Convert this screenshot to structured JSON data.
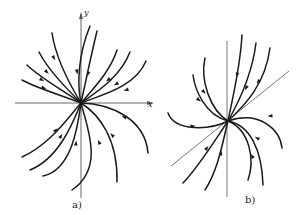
{
  "figure": {
    "stroke_color": "#1a1a1a",
    "axis_color": "#555555",
    "panel_a": {
      "label": "a)",
      "x_axis_label": "x",
      "y_axis_label": "y",
      "origin": [
        81,
        103
      ],
      "x_axis": [
        15,
        152
      ],
      "y_axis": [
        14,
        198
      ],
      "trajectories": [
        {
          "d": "M81,103 C70,85 56,60 52,33",
          "arrow": [
            54,
            58
          ],
          "dir": "in"
        },
        {
          "d": "M81,103 C68,90 48,70 39,52",
          "arrow": [
            47,
            72
          ],
          "dir": "in"
        },
        {
          "d": "M81,103 C66,92 40,78 27,65",
          "arrow": [
            42,
            80
          ],
          "dir": "in"
        },
        {
          "d": "M81,103 C64,96 36,88 22,80",
          "arrow": [
            44,
            88
          ],
          "dir": "in"
        },
        {
          "d": "M81,103 C77,85 78,55 90,26",
          "arrow": [
            77,
            72
          ],
          "dir": "in"
        },
        {
          "d": "M81,103 C85,85 90,60 97,31",
          "arrow": [
            88,
            74
          ],
          "dir": "in"
        },
        {
          "d": "M81,103 C92,90 110,72 117,50",
          "arrow": [
            108,
            80
          ],
          "dir": "in"
        },
        {
          "d": "M81,103 C95,93 120,78 130,52",
          "arrow": [
            116,
            84
          ],
          "dir": "in"
        },
        {
          "d": "M81,103 C98,96 135,88 146,61",
          "arrow": [
            126,
            90
          ],
          "dir": "in"
        },
        {
          "d": "M81,103 C70,115 50,145 22,157",
          "arrow": [
            56,
            130
          ],
          "dir": "in"
        },
        {
          "d": "M81,103 C74,120 60,158 30,170",
          "arrow": [
            61,
            136
          ],
          "dir": "in"
        },
        {
          "d": "M81,103 C78,125 72,170 43,176",
          "arrow": [
            76,
            143
          ],
          "dir": "in"
        },
        {
          "d": "M81,103 C88,130 104,168 72,190",
          "arrow": [
            99,
            142
          ],
          "dir": "in"
        },
        {
          "d": "M81,103 C100,115 118,140 117,182",
          "arrow": [
            112,
            135
          ],
          "dir": "in"
        },
        {
          "d": "M81,103 C110,104 145,118 148,153",
          "arrow": [
            124,
            117
          ],
          "dir": "in"
        }
      ]
    },
    "panel_b": {
      "label": "b)",
      "origin": [
        228,
        121
      ],
      "vertical_axis": [
        41,
        197
      ],
      "diagonal": [
        [
          171,
          166
        ],
        [
          289,
          71
        ]
      ],
      "trajectories": [
        {
          "d": "M228,121 C205,115 195,90 193,75",
          "arrow": [
            199,
            100
          ],
          "dir": "in"
        },
        {
          "d": "M228,121 C210,110 200,80 205,58",
          "arrow": [
            204,
            92
          ],
          "dir": "in"
        },
        {
          "d": "M228,121 C232,100 240,70 242,35",
          "arrow": [
            237,
            75
          ],
          "dir": "in"
        },
        {
          "d": "M228,121 C240,100 252,75 256,43",
          "arrow": [
            246,
            88
          ],
          "dir": "in"
        },
        {
          "d": "M228,121 C245,105 265,85 270,48",
          "arrow": [
            258,
            82
          ],
          "dir": "in"
        },
        {
          "d": "M228,121 C210,130 175,132 168,113",
          "arrow": [
            193,
            126
          ],
          "dir": "in"
        },
        {
          "d": "M228,121 C215,140 200,165 183,183",
          "arrow": [
            207,
            148
          ],
          "dir": "in"
        },
        {
          "d": "M228,121 C222,145 218,170 205,190",
          "arrow": [
            221,
            153
          ],
          "dir": "in"
        },
        {
          "d": "M228,121 C250,130 255,160 248,180",
          "arrow": [
            252,
            156
          ],
          "dir": "in"
        },
        {
          "d": "M228,121 C250,125 262,150 263,185",
          "arrow": [
            257,
            138
          ],
          "dir": "in"
        },
        {
          "d": "M228,121 C260,110 280,130 282,148",
          "arrow": [
            270,
            116
          ],
          "dir": "in"
        }
      ]
    }
  }
}
